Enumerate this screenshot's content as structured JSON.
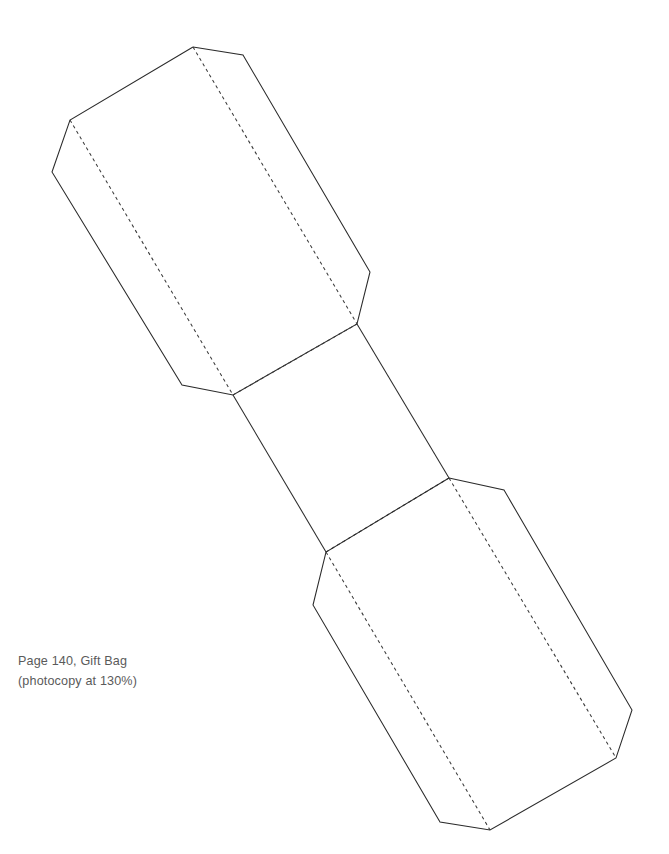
{
  "page": {
    "background_color": "#ffffff",
    "width": 669,
    "height": 854
  },
  "caption": {
    "line1": "Page 140, Gift Bag",
    "line2": "(photocopy at 130%)",
    "color": "#5a5a5a"
  },
  "diagram": {
    "name": "gift-bag-papercraft-template",
    "cut_line_color": "#2b2b2b",
    "fold_line_color": "#3a3a3a",
    "fold_line_style": "dashed",
    "panels": [
      {
        "id": "top-panel",
        "shape": "elongated-octagon",
        "points": "193,47 243,55 370,272 357,324 233,395 182,385 52,172 70,120"
      },
      {
        "id": "middle-panel",
        "shape": "parallelogram",
        "points": "233,395 357,324 449,478 326,552"
      },
      {
        "id": "bottom-panel",
        "shape": "elongated-octagon",
        "points": "449,478 504,490 632,710 616,758 490,830 440,822 313,605 326,552"
      }
    ],
    "cut_edges": [
      {
        "id": "top-panel-outline",
        "points": "193,47 243,55 370,272 357,324 233,395 182,385 52,172 70,120 193,47"
      },
      {
        "id": "middle-panel-left-edge",
        "points": "233,395 326,552"
      },
      {
        "id": "middle-panel-right-edge",
        "points": "357,324 449,478"
      },
      {
        "id": "bottom-panel-outline",
        "points": "449,478 504,490 632,710 616,758 490,830 440,822 313,605 326,552 449,478"
      }
    ],
    "fold_edges": [
      {
        "id": "top-panel-fold-right",
        "points": "193,47 357,324"
      },
      {
        "id": "top-panel-fold-left",
        "points": "70,120 233,395"
      },
      {
        "id": "middle-panel-fold-top",
        "points": "233,395 357,324"
      },
      {
        "id": "middle-panel-fold-bottom",
        "points": "326,552 449,478"
      },
      {
        "id": "bottom-panel-fold-right",
        "points": "449,478 616,758"
      },
      {
        "id": "bottom-panel-fold-left",
        "points": "326,552 490,830"
      }
    ]
  }
}
